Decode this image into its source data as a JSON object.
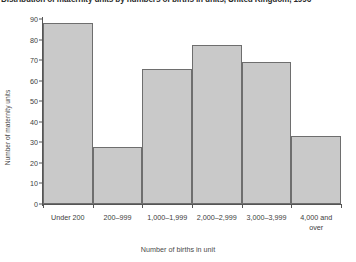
{
  "chart_data": {
    "type": "bar",
    "title": "Distribution of maternity units by numbers of births in units, United Kingdom, 1996",
    "subtitle": "",
    "xlabel": "Number of births in unit",
    "ylabel": "Number of maternity units",
    "categories": [
      "Under 200",
      "200–999",
      "1,000–1,999",
      "2,000–2,999",
      "3,000–3,999",
      "4,000 and\nover"
    ],
    "values": [
      88,
      27.5,
      65.5,
      77.5,
      69,
      33
    ],
    "ylim": [
      0,
      90
    ],
    "yticks": [
      0,
      10,
      20,
      30,
      40,
      50,
      60,
      70,
      80,
      90
    ],
    "ytick_labels": [
      "0",
      "10",
      "20",
      "30",
      "40",
      "50",
      "60",
      "70",
      "80",
      "90"
    ],
    "grid": false,
    "legend": false,
    "bar_fill_color": "#c9c9c9",
    "bar_edge_color": "#6e6e6e",
    "axis_color": "#555555",
    "bars_contiguous": true
  }
}
